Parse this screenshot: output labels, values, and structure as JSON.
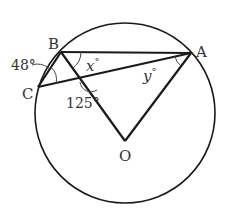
{
  "diagram": {
    "type": "circle-geometry",
    "circle": {
      "center": "O",
      "cx": 125,
      "cy": 113,
      "r": 90
    },
    "points": {
      "A": {
        "label": "A",
        "x": 191,
        "y": 53
      },
      "B": {
        "label": "B",
        "x": 61,
        "y": 52
      },
      "C": {
        "label": "C",
        "x": 38,
        "y": 87
      },
      "O": {
        "label": "O",
        "x": 125,
        "y": 141
      }
    },
    "segments": [
      "BA",
      "BC",
      "CA",
      "BO",
      "OA"
    ],
    "angles": {
      "angle_CBC_arc": {
        "label": "48°",
        "at": "B",
        "between": "BC-arc"
      },
      "angle_intersection": {
        "label": "125°",
        "at": "intersection of BO and CA"
      },
      "angle_x": {
        "label": "x",
        "degree": "°",
        "at": "B",
        "between": "BA, BO"
      },
      "angle_y": {
        "label": "y",
        "degree": "°",
        "at": "A",
        "between": "AC, AO"
      }
    },
    "colors": {
      "stroke": "#1a1a1a",
      "text": "#333333",
      "background": "#ffffff"
    }
  }
}
